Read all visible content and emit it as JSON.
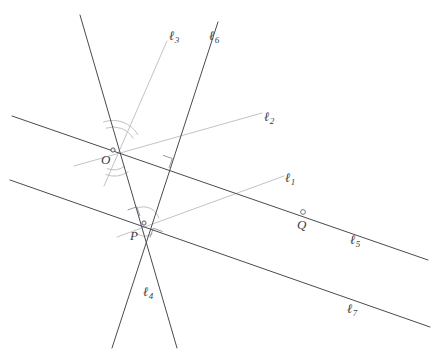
{
  "figure": {
    "type": "geometry-line-diagram",
    "width": 439,
    "height": 361,
    "background": "#ffffff",
    "colors": {
      "dark_line": "#4a4a52",
      "light_line": "#c3c3c8",
      "arc_mark": "#c0c0c6",
      "right_angle_mark": "#9a9aa2",
      "label_text": "#3c3c44"
    }
  },
  "points": [
    {
      "id": "O",
      "label": "O",
      "label_x": 101,
      "label_y": 153,
      "x": 113,
      "y": 150,
      "marker": "dot",
      "description": "intersection of lines 2, 3, 4, 5, 6"
    },
    {
      "id": "P",
      "label": "P",
      "label_x": 130,
      "label_y": 229,
      "x": 144,
      "y": 223,
      "marker": "dot",
      "description": "intersection of lines 1, 4, 6, 7"
    },
    {
      "id": "Q",
      "label": "Q",
      "label_x": 297,
      "label_y": 218,
      "x": 303,
      "y": 212,
      "marker": "open-circle",
      "description": "point on line 5"
    }
  ],
  "lines": [
    {
      "id": "l1",
      "label": "ℓ",
      "subscript": "1",
      "style": "light",
      "x1": 117,
      "y1": 237,
      "x2": 284,
      "y2": 176,
      "label_x": 285,
      "label_y": 171,
      "passes_through": [
        "P"
      ]
    },
    {
      "id": "l2",
      "label": "ℓ",
      "subscript": "2",
      "style": "light",
      "x1": 74,
      "y1": 166,
      "x2": 262,
      "y2": 113,
      "label_x": 264,
      "label_y": 110,
      "passes_through": [
        "O"
      ]
    },
    {
      "id": "l3",
      "label": "ℓ",
      "subscript": "3",
      "style": "light",
      "x1": 104,
      "y1": 186,
      "x2": 167,
      "y2": 41,
      "label_x": 169,
      "label_y": 29,
      "passes_through": [
        "O"
      ]
    },
    {
      "id": "l4",
      "label": "ℓ",
      "subscript": "4",
      "style": "dark",
      "x1": 80,
      "y1": 15,
      "x2": 177,
      "y2": 348,
      "label_x": 143,
      "label_y": 285,
      "passes_through": [
        "O",
        "P"
      ]
    },
    {
      "id": "l5",
      "label": "ℓ",
      "subscript": "5",
      "style": "dark",
      "x1": 12,
      "y1": 116,
      "x2": 428,
      "y2": 260,
      "label_x": 350,
      "label_y": 233,
      "passes_through": [
        "O",
        "Q"
      ]
    },
    {
      "id": "l6",
      "label": "ℓ",
      "subscript": "6",
      "style": "dark",
      "x1": 218,
      "y1": 22,
      "x2": 112,
      "y2": 348,
      "label_x": 209,
      "label_y": 29,
      "passes_through": [
        "O",
        "P"
      ]
    },
    {
      "id": "l7",
      "label": "ℓ",
      "subscript": "7",
      "style": "dark",
      "x1": 10,
      "y1": 180,
      "x2": 430,
      "y2": 327,
      "label_x": 347,
      "label_y": 302,
      "passes_through": [
        "P"
      ]
    }
  ],
  "angle_marks": [
    {
      "id": "arc-o-upper",
      "at": "O",
      "type": "arc",
      "radius": 22
    },
    {
      "id": "arc-o-lower",
      "at": "O",
      "type": "arc",
      "radius": 16
    },
    {
      "id": "arc-p-upper",
      "at": "P",
      "type": "arc",
      "radius": 14
    },
    {
      "id": "arc-p-lower",
      "at": "P",
      "type": "arc",
      "radius": 12
    }
  ],
  "right_angle_marks": [
    {
      "id": "right-angle-l5-l6",
      "x": 168,
      "y": 162,
      "description": "square mark where line 6 meets line 5"
    },
    {
      "id": "right-angle-l7-l6",
      "x": 131,
      "y": 215,
      "description": "square mark near P on line 7"
    },
    {
      "id": "right-angle-l1-l4",
      "x": 157,
      "y": 228,
      "description": "square mark near P on line 1"
    }
  ]
}
